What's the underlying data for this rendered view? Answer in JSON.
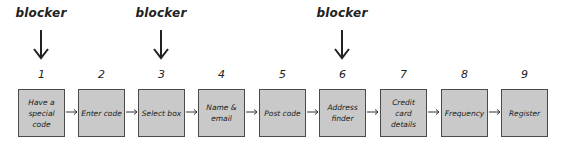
{
  "diagram": {
    "blocker_label": "blocker",
    "blockers": [
      {
        "step": 1,
        "label": "blocker"
      },
      {
        "step": 3,
        "label": "blocker"
      },
      {
        "step": 6,
        "label": "blocker"
      }
    ],
    "steps": [
      {
        "number": "1",
        "label": "Have a special code"
      },
      {
        "number": "2",
        "label": "Enter code"
      },
      {
        "number": "3",
        "label": "Select box"
      },
      {
        "number": "4",
        "label": "Name & email"
      },
      {
        "number": "5",
        "label": "Post code"
      },
      {
        "number": "6",
        "label": "Address finder"
      },
      {
        "number": "7",
        "label": "Credit card details"
      },
      {
        "number": "8",
        "label": "Frequency"
      },
      {
        "number": "9",
        "label": "Register"
      }
    ],
    "colors": {
      "box_fill": "#c9c9c9",
      "box_border": "#4a4a4a",
      "arrow": "#222222"
    }
  }
}
